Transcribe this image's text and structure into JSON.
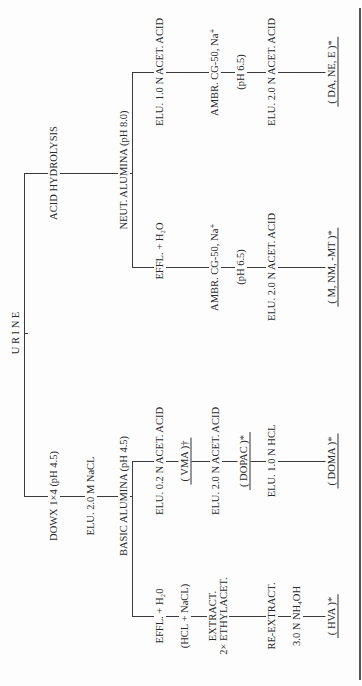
{
  "diagram": {
    "root": "U R I N E",
    "top_branch": {
      "step1": "ACID HYDROLYSIS",
      "step2": "NEUT. ALUMINA (pH 8.0)",
      "branch_a": {
        "step1": "ELU. 1.0 N ACET. ACID",
        "step2": "AMBR. CG-50, Na⁺",
        "step3": "(pH 6.5)",
        "step4": "ELU. 2.0 N ACET. ACID",
        "product": "( DA, NE, E )*"
      },
      "branch_b": {
        "step1": "EFFL. + H₂O",
        "step2": "AMBR. CG-50, Na⁺",
        "step3": "(pH 6.5)",
        "step4": "ELU. 2.0 N ACET. ACID",
        "product": "( M, NM, -MT )*"
      }
    },
    "bottom_branch": {
      "step1": "DOWX 1×4 (pH 4.5)",
      "step2": "ELU. 2.0 M NaCL",
      "step3": "BASIC ALUMINA (pH 4.5)",
      "branch_a": {
        "step1": "ELU. 0.2 N ACET. ACID",
        "product1": "( VMA )†",
        "step2": "ELU. 2.0 N ACET. ACID",
        "product2": "( DOPAC )*",
        "step3": "ELU. 1.0 N HCL",
        "product3": "( DOMA )*"
      },
      "branch_b": {
        "step1": "EFFL. + H₂0",
        "step2": "(HCL + NaCL)",
        "step3_line1": "EXTRACT.",
        "step3_line2": "2× ETHYLACET.",
        "step4": "RE-EXTRACT.",
        "step5": "3.0 N NH₄OH",
        "product": "( HVA )*"
      }
    }
  }
}
